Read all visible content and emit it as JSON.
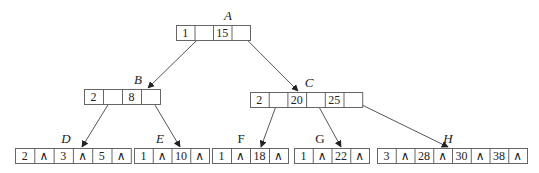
{
  "nodes": [
    {
      "id": "A",
      "label": "A",
      "label_style": "italic",
      "x": 176,
      "y": 25,
      "cell_w": 18.5,
      "cells": [
        "1",
        "/",
        "15",
        "\\"
      ],
      "label_x": 228,
      "label_y": 20
    },
    {
      "id": "B",
      "label": "B",
      "label_style": "italic",
      "x": 84,
      "y": 89,
      "cell_w": 19,
      "cells": [
        "2",
        "/",
        "8",
        "\\"
      ],
      "label_x": 138,
      "label_y": 84
    },
    {
      "id": "C",
      "label": "C",
      "label_style": "italic",
      "x": 250,
      "y": 92,
      "cell_w": 18.7,
      "cells": [
        "2",
        "/",
        "20",
        "\\",
        "25",
        "\\"
      ],
      "label_x": 309,
      "label_y": 87
    },
    {
      "id": "D",
      "label": "D",
      "label_style": "italic",
      "x": 15,
      "y": 148,
      "cell_w": 19.3,
      "cells": [
        "2",
        "∧",
        "3",
        "∧",
        "5",
        "∧"
      ],
      "label_x": 66,
      "label_y": 143
    },
    {
      "id": "E",
      "label": "E",
      "label_style": "italic",
      "x": 134,
      "y": 148,
      "cell_w": 18.75,
      "cells": [
        "1",
        "∧",
        "10",
        "∧"
      ],
      "label_x": 160,
      "label_y": 143
    },
    {
      "id": "F",
      "label": "F",
      "label_style": "upright",
      "x": 212,
      "y": 148,
      "cell_w": 19,
      "cells": [
        "1",
        "∧",
        "18",
        "∧"
      ],
      "label_x": 241,
      "label_y": 143
    },
    {
      "id": "G",
      "label": "G",
      "label_style": "upright",
      "x": 294,
      "y": 148,
      "cell_w": 18.75,
      "cells": [
        "1",
        "∧",
        "22",
        "∧"
      ],
      "label_x": 320,
      "label_y": 143
    },
    {
      "id": "H",
      "label": "H",
      "label_style": "italic",
      "x": 377,
      "y": 148,
      "cell_w": 18.75,
      "cells": [
        "3",
        "∧",
        "28",
        "∧",
        "30",
        "∧",
        "38",
        "∧"
      ],
      "label_x": 448,
      "label_y": 143
    }
  ],
  "edges": [
    {
      "from": "A",
      "from_cell": 1,
      "to": "B",
      "tx": 148,
      "ty": 88
    },
    {
      "from": "A",
      "from_cell": 3,
      "to": "C",
      "tx": 298,
      "ty": 91
    },
    {
      "from": "B",
      "from_cell": 1,
      "to": "D",
      "tx": 82,
      "ty": 147
    },
    {
      "from": "B",
      "from_cell": 3,
      "to": "E",
      "tx": 180,
      "ty": 147
    },
    {
      "from": "C",
      "from_cell": 1,
      "to": "F",
      "tx": 261,
      "ty": 147
    },
    {
      "from": "C",
      "from_cell": 3,
      "to": "G",
      "tx": 341,
      "ty": 147
    },
    {
      "from": "C",
      "from_cell": 5,
      "to": "H",
      "tx": 448,
      "ty": 147
    }
  ],
  "colors": {
    "line": "#555555",
    "box": "#666666",
    "text": "#222222",
    "background": "#ffffff"
  }
}
